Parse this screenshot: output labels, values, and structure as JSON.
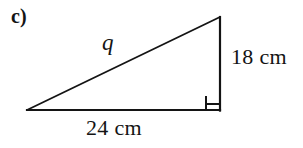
{
  "figure": {
    "part_label": "c)",
    "shape": "right-triangle",
    "stroke_color": "#141414",
    "background_color": "#ffffff",
    "vertices": {
      "bottom_left": [
        27,
        110
      ],
      "bottom_right": [
        220,
        110
      ],
      "top_right": [
        220,
        17
      ]
    },
    "right_angle_marker": {
      "at_vertex": "bottom_right",
      "size": 14
    },
    "labels": {
      "hypotenuse": "q",
      "vertical_leg": "18 cm",
      "base_leg": "24 cm"
    },
    "measurements": {
      "vertical_leg_value": 18,
      "base_leg_value": 24,
      "unit": "cm",
      "hypotenuse_variable": "q"
    }
  }
}
